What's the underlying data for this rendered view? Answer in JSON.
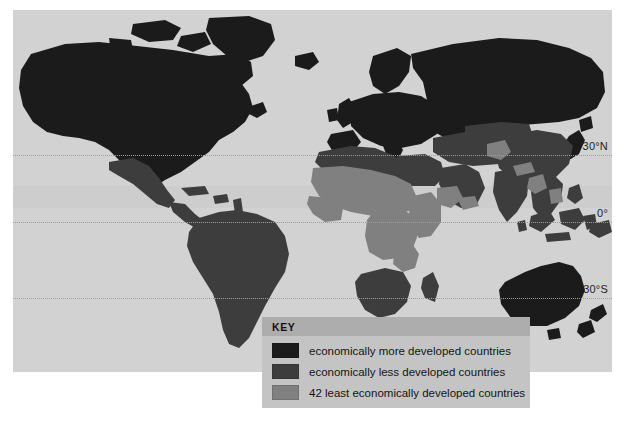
{
  "map": {
    "title": "World map of development status",
    "projection": "equirectangular",
    "ocean_color": "#d2d2d2",
    "graticule": {
      "color": "#9d9d9d",
      "style": "dotted",
      "labels": [
        {
          "name": "lat-30n",
          "text": "30°N",
          "y": 145
        },
        {
          "name": "lat-0",
          "text": "0°",
          "y": 212
        },
        {
          "name": "lat-30s",
          "text": "30°S",
          "y": 288
        }
      ]
    }
  },
  "legend": {
    "header": "KEY",
    "items": [
      {
        "label": "economically more developed countries",
        "color": "#1b1b1b",
        "swatch_name": "swatch-more-developed"
      },
      {
        "label": "economically less developed countries",
        "color": "#3d3d3d",
        "swatch_name": "swatch-less-developed"
      },
      {
        "label": "42 least economically developed countries",
        "color": "#808080",
        "swatch_name": "swatch-least-developed"
      }
    ]
  },
  "categories": {
    "more_developed": {
      "color": "#1b1b1b",
      "regions": [
        "North America",
        "Greenland",
        "Europe",
        "Russia",
        "Japan",
        "Australia",
        "New Zealand"
      ]
    },
    "less_developed": {
      "color": "#3d3d3d",
      "regions": [
        "South America",
        "Central America",
        "North Africa",
        "Southern Africa",
        "Middle East",
        "China",
        "India",
        "Southeast Asia",
        "Indonesia"
      ]
    },
    "least_developed": {
      "color": "#808080",
      "regions": [
        "Sahel",
        "West Africa",
        "East Africa",
        "Central Africa",
        "Afghanistan",
        "Nepal",
        "Bangladesh",
        "Yemen"
      ]
    }
  }
}
